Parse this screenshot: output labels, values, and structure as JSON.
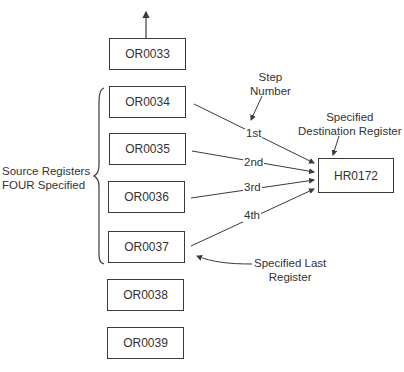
{
  "diagram": {
    "source_registers": [
      {
        "id": "OR0033",
        "label": "OR0033"
      },
      {
        "id": "OR0034",
        "label": "OR0034"
      },
      {
        "id": "OR0035",
        "label": "OR0035"
      },
      {
        "id": "OR0036",
        "label": "OR0036"
      },
      {
        "id": "OR0037",
        "label": "OR0037"
      },
      {
        "id": "OR0038",
        "label": "OR0038"
      },
      {
        "id": "OR0039",
        "label": "OR0039"
      }
    ],
    "destination_register": {
      "label": "HR0172"
    },
    "steps": [
      {
        "label": "1st",
        "from": "OR0034"
      },
      {
        "label": "2nd",
        "from": "OR0035"
      },
      {
        "label": "3rd",
        "from": "OR0036"
      },
      {
        "label": "4th",
        "from": "OR0037"
      }
    ],
    "annotations": {
      "source_group_line1": "Source Registers",
      "source_group_line2": "FOUR Specified",
      "step_number_line1": "Step",
      "step_number_line2": "Number",
      "destination_line1": "Specified",
      "destination_line2": "Destination Register",
      "last_register_line1": "Specified Last",
      "last_register_line2": "Register"
    },
    "colors": {
      "stroke": "#3a3a3a",
      "text": "#333333",
      "background": "#ffffff"
    }
  }
}
